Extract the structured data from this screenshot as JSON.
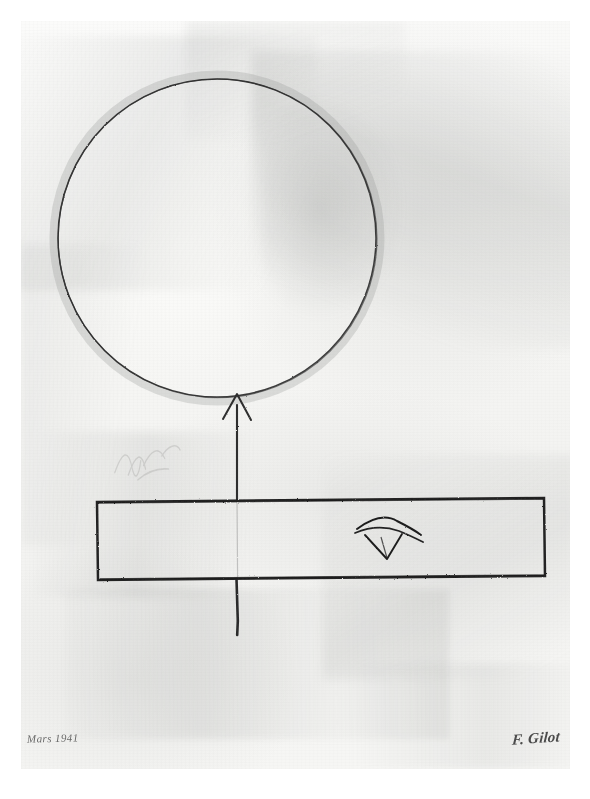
{
  "artwork": {
    "title": "Abstract composition with circle, arrow and bar",
    "medium_appearance": "graphite and gray wash on paper",
    "date_inscription": "Mars 1941",
    "signature": "F. Gilot",
    "paper_color": "#f5f5f3",
    "line_color": "#2a2a2a",
    "wash_color": "#9a9c9a",
    "background_color": "#ffffff"
  },
  "elements": {
    "circle": {
      "name": "Large circle",
      "center_x": 196,
      "center_y": 217,
      "radius": 159,
      "stroke": "#2e2e2e",
      "stroke_width": 1.6,
      "fill": "none"
    },
    "arrow": {
      "name": "Vertical upward arrow",
      "x": 216,
      "tip_y": 372,
      "tail_y": 614,
      "head_half_width": 14,
      "head_height": 26,
      "stroke": "#2b2b2b",
      "stroke_width": 2.2
    },
    "bar": {
      "name": "Horizontal rectangular bar",
      "left": 76,
      "top": 480,
      "right": 524,
      "bottom": 558,
      "stroke": "#222222",
      "stroke_width": 2.6,
      "fill": "none"
    },
    "eye_glyph": {
      "name": "Eye motif inside the bar",
      "center_x": 366,
      "center_y": 516,
      "stroke": "#1f1f1f",
      "stroke_width": 2.0
    }
  },
  "labels": {
    "frame": "artwork-canvas",
    "paper": "paper-sheet",
    "circle": "circle-shape",
    "arrow": "arrow-shape",
    "bar": "bar-shape",
    "eye": "eye-glyph"
  }
}
